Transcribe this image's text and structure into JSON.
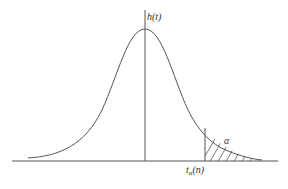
{
  "diagram": {
    "type": "t-distribution density curve with right-tail rejection region",
    "y_axis_label": "h(t)",
    "critical_value_label": {
      "base": "t",
      "subscript": "α",
      "suffix": "(n)"
    },
    "tail_area_label": "α",
    "colors": {
      "stroke": "#555555",
      "background": "#ffffff"
    }
  }
}
